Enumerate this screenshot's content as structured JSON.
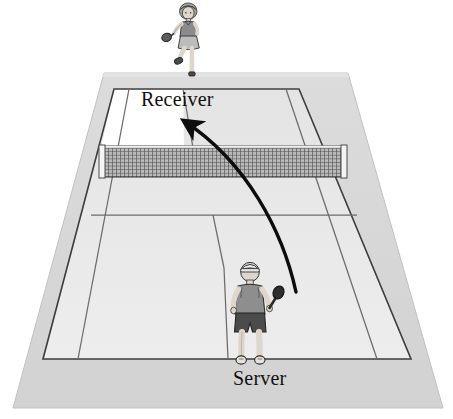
{
  "diagram": {
    "type": "sports-court-illustration",
    "labels": {
      "receiver": "Receiver",
      "server": "Server"
    },
    "colors": {
      "background": "#ffffff",
      "apron": "#d7d7d7",
      "apron_edge": "#c9c9c9",
      "court_surface": "#e9e9e9",
      "court_surface_far": "#e4e4e4",
      "highlight_box": "#ffffff",
      "line": "#3a3a3a",
      "line_light": "#6d6d6d",
      "net_mesh": "#4a4a4a",
      "net_post": "#f2f2f2",
      "arrow": "#0d0d0d",
      "skin": "#d9d2c8",
      "shirt_server": "#8e8e8e",
      "shorts_server": "#4c4c4c",
      "cap_server": "#f0f0f0",
      "racket_server": "#2c2c2c",
      "shirt_receiver": "#8b8b8b",
      "skirt_receiver": "#b9b9b9",
      "hair_receiver": "#a8a39a",
      "racket_receiver": "#4a4a4a"
    },
    "court": {
      "apron_polygon": "13,408 104,73 348,73 443,408",
      "outer_court_polygon": "43,359 114,89 299,89 411,359",
      "service_line_far": "114,89 299,89",
      "service_line_near": "91,215 357,215",
      "net_line": "101,148 345,148",
      "center_service_line": "183,89 224,215",
      "center_mark": "224,215 224,359",
      "singles_sideline_left": "129,89 78,359",
      "singles_sideline_right": "286,89 377,359"
    },
    "net": {
      "left_post_x": 101,
      "right_post_x": 345,
      "top_y": 146,
      "bottom_y": 178,
      "mesh_cols": 60,
      "mesh_rows": 9
    },
    "arrow": {
      "description": "curved serve trajectory from server racket to receiver service box",
      "start": "296,292",
      "control": "272,150",
      "end": "178,116",
      "head_at": "178,116",
      "head_direction": "up-left"
    },
    "figures": [
      {
        "name": "receiver",
        "position": "top",
        "x": 185,
        "y": 5,
        "facing": "toward-viewer",
        "holding": "racket-left-hand",
        "pose": "one-leg-raised",
        "gender_presentation": "skirt"
      },
      {
        "name": "server",
        "position": "bottom",
        "x": 238,
        "y": 258,
        "facing": "away-from-viewer",
        "holding": "racket-right-hand",
        "pose": "follow-through",
        "wears": "cap"
      }
    ]
  }
}
